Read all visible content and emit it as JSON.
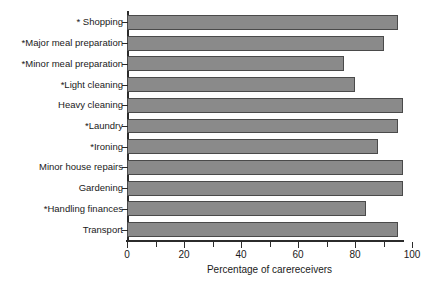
{
  "chart_data": {
    "type": "bar",
    "orientation": "horizontal",
    "title": "",
    "xlabel": "Percentage of carereceivers",
    "ylabel": "",
    "xlim": [
      0,
      100
    ],
    "grid": false,
    "legend": null,
    "xticks": [
      0,
      20,
      40,
      60,
      80,
      100
    ],
    "xtick_labels": [
      "0",
      "20",
      "40",
      "60",
      "80",
      "100"
    ],
    "minor_tick_interval": 10,
    "bar_color": "#8a8a8a",
    "bar_edge_color": "#4a4a4a",
    "axis_color": "#2b2b2b",
    "categories": [
      "* Shopping",
      "*Major meal preparation",
      "*Minor meal preparation",
      "*Light cleaning",
      "Heavy cleaning",
      "*Laundry",
      "*Ironing",
      "Minor house repairs",
      "Gardening",
      "*Handling finances",
      "Transport"
    ],
    "values": [
      95,
      90,
      76,
      80,
      97,
      95,
      88,
      97,
      97,
      84,
      95
    ]
  },
  "axis": {
    "x_title": "Percentage of carereceivers"
  }
}
